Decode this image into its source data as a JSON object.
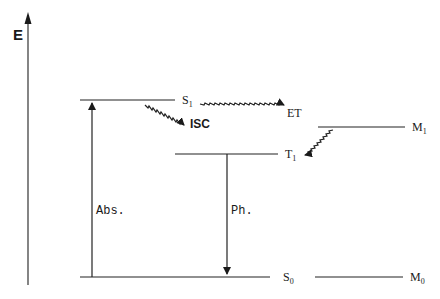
{
  "diagram": {
    "type": "energy-level (Jablonski) diagram",
    "axis": {
      "label": "E"
    },
    "levels": [
      {
        "id": "S1",
        "label": "S",
        "sub": "1"
      },
      {
        "id": "T1",
        "label": "T",
        "sub": "1"
      },
      {
        "id": "S0",
        "label": "S",
        "sub": "0"
      },
      {
        "id": "M1",
        "label": "M",
        "sub": "1"
      },
      {
        "id": "M0",
        "label": "M",
        "sub": "0"
      }
    ],
    "transitions": [
      {
        "id": "abs",
        "label": "Abs.",
        "from": "S0",
        "to": "S1",
        "style": "straight"
      },
      {
        "id": "isc",
        "label": "ISC",
        "from": "S1",
        "to": "T1",
        "style": "wavy"
      },
      {
        "id": "et",
        "label": "ET",
        "from": "S1",
        "to": "M1",
        "style": "wavy"
      },
      {
        "id": "back",
        "label": "",
        "from": "M1",
        "to": "T1",
        "style": "wavy"
      },
      {
        "id": "ph",
        "label": "Ph.",
        "from": "T1",
        "to": "S0",
        "style": "straight"
      }
    ],
    "colors": {
      "line": "#1a1a1a",
      "background": "#ffffff"
    }
  }
}
